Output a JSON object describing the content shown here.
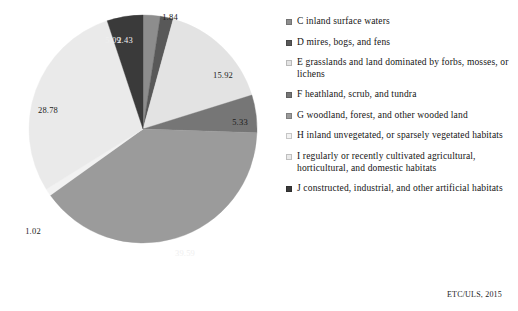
{
  "chart_data": {
    "type": "pie",
    "title": "",
    "subtitle": "",
    "xlabel": "",
    "ylabel": "",
    "units": "percent",
    "legend_position": "right",
    "grid": false,
    "start_angle_deg": 0,
    "direction": "clockwise",
    "total": 100.0,
    "categories": [
      "C inland surface waters",
      "D mires, bogs, and fens",
      "E grasslands and land dominated by forbs, mosses, or lichens",
      "F heathland, scrub, and tundra",
      "G woodland, forest, and other wooded land",
      "H inland unvegetated, or sparsely vegetated habitats",
      "I regularly or recently cultivated agricultural, horticultural, and domestic habitats",
      "J constructed, industrial, and other artificial habitats"
    ],
    "values": [
      2.43,
      1.84,
      15.92,
      5.33,
      39.59,
      1.02,
      28.78,
      5.09
    ],
    "labels": [
      "2.43",
      "1.84",
      "15.92",
      "5.33",
      "39.59",
      "1.02",
      "28.78",
      "5.09"
    ],
    "colors": [
      "#8d8d8d",
      "#585858",
      "#e3e3e3",
      "#767676",
      "#9b9b9b",
      "#f2f2f2",
      "#eaeaea",
      "#3a3a3a"
    ],
    "slices": [
      {
        "key": "C",
        "label_text": "2.43",
        "value": 2.43,
        "color": "#8d8d8d",
        "label_on_dark": true,
        "label_x": 125,
        "label_y": 40
      },
      {
        "key": "D",
        "label_text": "1.84",
        "value": 1.84,
        "color": "#585858",
        "label_on_dark": false,
        "label_x": 170,
        "label_y": 17
      },
      {
        "key": "E",
        "label_text": "15.92",
        "value": 15.92,
        "color": "#e3e3e3",
        "label_on_dark": false,
        "label_x": 223,
        "label_y": 75
      },
      {
        "key": "F",
        "label_text": "5.33",
        "value": 5.33,
        "color": "#767676",
        "label_on_dark": false,
        "label_x": 240,
        "label_y": 122
      },
      {
        "key": "G",
        "label_text": "39.59",
        "value": 39.59,
        "color": "#9b9b9b",
        "label_on_dark": true,
        "label_x": 185,
        "label_y": 253
      },
      {
        "key": "H",
        "label_text": "1.02",
        "value": 1.02,
        "color": "#f2f2f2",
        "label_on_dark": false,
        "label_x": 33,
        "label_y": 231
      },
      {
        "key": "I",
        "label_text": "28.78",
        "value": 28.78,
        "color": "#eaeaea",
        "label_on_dark": false,
        "label_x": 48,
        "label_y": 110
      },
      {
        "key": "J",
        "label_text": "5.09",
        "value": 5.09,
        "color": "#3a3a3a",
        "label_on_dark": true,
        "label_x": 113,
        "label_y": 40
      }
    ]
  },
  "legend": {
    "items": [
      {
        "label": "C inland surface waters",
        "color": "#8d8d8d"
      },
      {
        "label": "D mires, bogs, and fens",
        "color": "#585858"
      },
      {
        "label": "E grasslands and land dominated by forbs, mosses, or lichens",
        "color": "#e3e3e3"
      },
      {
        "label": "F heathland, scrub, and tundra",
        "color": "#767676"
      },
      {
        "label": "G woodland, forest, and other wooded land",
        "color": "#9b9b9b"
      },
      {
        "label": "H inland unvegetated, or sparsely vegetated habitats",
        "color": "#f2f2f2"
      },
      {
        "label": "I regularly or recently cultivated agricultural, horticultural, and domestic habitats",
        "color": "#eaeaea"
      },
      {
        "label": "J constructed, industrial, and other artificial habitats",
        "color": "#3a3a3a"
      }
    ]
  },
  "source": {
    "text": "ETC/ULS, 2015"
  }
}
